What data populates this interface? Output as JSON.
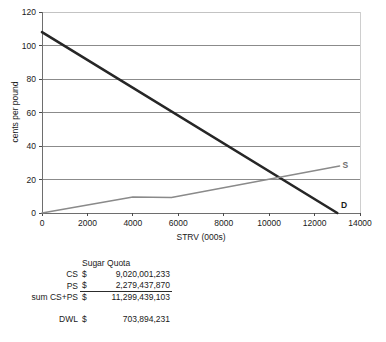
{
  "chart_data": {
    "type": "line",
    "title": "",
    "xlabel": "STRV (000s)",
    "ylabel": "cents per pound",
    "xlim": [
      0,
      14000
    ],
    "ylim": [
      0,
      120
    ],
    "xticks": [
      0,
      2000,
      4000,
      6000,
      8000,
      10000,
      12000,
      14000
    ],
    "yticks": [
      0,
      20,
      40,
      60,
      80,
      100,
      120
    ],
    "xtick_labels": [
      "0",
      "2000",
      "4000",
      "6000",
      "8000",
      "10000",
      "12000",
      "14000"
    ],
    "ytick_labels": [
      "0",
      "20",
      "40",
      "60",
      "80",
      "100",
      "120"
    ],
    "grid": "horizontal",
    "legend": "inline-end-labels",
    "series": [
      {
        "name": "D",
        "label": "D",
        "color": "#262626",
        "width": 2.6,
        "points": [
          [
            0,
            108
          ],
          [
            13000,
            0
          ]
        ]
      },
      {
        "name": "S",
        "label": "S",
        "color": "#8a8a8a",
        "width": 1.5,
        "points": [
          [
            0,
            0
          ],
          [
            4000,
            9.5
          ],
          [
            5700,
            9.3
          ],
          [
            13100,
            28
          ]
        ]
      }
    ],
    "annotations": [
      {
        "text": "S",
        "x": 13350,
        "y": 28.5
      },
      {
        "text": "D",
        "x": 13300,
        "y": 4.5
      }
    ]
  },
  "table": {
    "header": "Sugar Quota",
    "currency_symbol": "$",
    "rows": [
      {
        "label": "CS",
        "amount": "9,020,001,233"
      },
      {
        "label": "PS",
        "amount": "2,279,437,870"
      },
      {
        "label": "sum CS+PS",
        "amount": "11,299,439,103"
      }
    ],
    "dwl": {
      "label": "DWL",
      "amount": "703,894,231"
    }
  }
}
